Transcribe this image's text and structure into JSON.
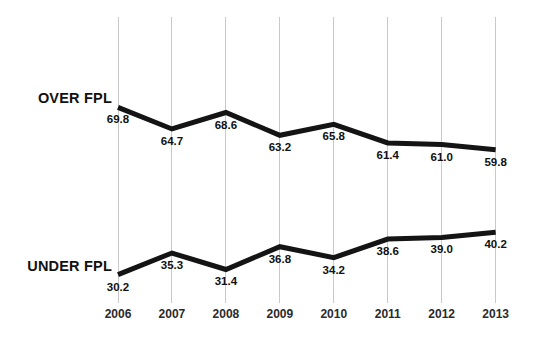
{
  "chart_data": {
    "type": "line",
    "title": "",
    "subtitle": "",
    "xlabel": "",
    "ylabel": "",
    "categories": [
      "2006",
      "2007",
      "2008",
      "2009",
      "2010",
      "2011",
      "2012",
      "2013"
    ],
    "ylim": [
      0,
      100
    ],
    "grid": "vertical-only",
    "legend_position": "inline-left",
    "series": [
      {
        "name": "OVER FPL",
        "values": [
          69.8,
          64.7,
          68.6,
          63.2,
          65.8,
          61.4,
          61.0,
          59.8
        ],
        "labels": [
          "69.8",
          "64.7",
          "68.6",
          "63.2",
          "65.8",
          "61.4",
          "61.0",
          "59.8"
        ],
        "color": "#141414"
      },
      {
        "name": "UNDER FPL",
        "values": [
          30.2,
          35.3,
          31.4,
          36.8,
          34.2,
          38.6,
          39.0,
          40.2
        ],
        "labels": [
          "30.2",
          "35.3",
          "31.4",
          "36.8",
          "34.2",
          "38.6",
          "39.0",
          "40.2"
        ],
        "color": "#141414"
      }
    ]
  },
  "style": {
    "background": "#ffffff",
    "line_color": "#141414",
    "gridline_color": "#c9c9c9",
    "label_color": "#111111",
    "tick_color": "#2b2b2b"
  }
}
